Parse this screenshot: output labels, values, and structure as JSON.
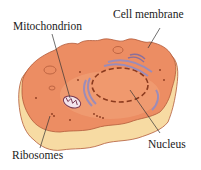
{
  "diagram": {
    "labels": {
      "mitochondrion": "Mitochondrion",
      "cell_membrane": "Cell membrane",
      "nucleus": "Nucleus",
      "ribosomes": "Ribosomes"
    },
    "colors": {
      "cytoplasm": "#ec8d63",
      "cytoplasm_light": "#f2a57c",
      "membrane_side": "#f7dba3",
      "membrane_edge": "#b35a3a",
      "nuclear_envelope": "#8b3a1e",
      "er": "#9c8cb8",
      "leader_line": "#333333"
    }
  }
}
